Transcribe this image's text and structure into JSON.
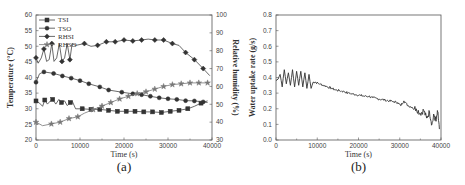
{
  "chart_data": [
    {
      "type": "line",
      "panel_label": "(a)",
      "title": "",
      "xlabel": "Time (s)",
      "ylabel": "Temperature (°C)",
      "y2label": "Relative humidity (%)",
      "xlim": [
        0,
        40000
      ],
      "ylim": [
        20,
        60
      ],
      "y2lim": [
        30,
        100
      ],
      "xticks": [
        "0",
        "10000",
        "20000",
        "30000",
        "40000"
      ],
      "yticks": [
        "20",
        "25",
        "30",
        "35",
        "40",
        "45",
        "50",
        "55",
        "60"
      ],
      "y2ticks": [
        "30",
        "40",
        "50",
        "60",
        "70",
        "80",
        "90",
        "100"
      ],
      "grid": false,
      "legend_position": "upper-left",
      "series": [
        {
          "name": "TSI",
          "axis": "left",
          "marker": "square",
          "x": [
            0,
            800,
            1500,
            2000,
            2600,
            3300,
            3800,
            4500,
            5200,
            5800,
            6500,
            7100,
            7800,
            8200,
            9000,
            10500,
            12500,
            14500,
            16500,
            18500,
            20500,
            22500,
            24500,
            26500,
            28500,
            30500,
            32500,
            34500,
            36000,
            37500,
            39000
          ],
          "values": [
            32.5,
            31.8,
            30.8,
            32.8,
            31.5,
            32.5,
            33,
            31.5,
            33,
            32,
            32.5,
            31,
            32,
            32.5,
            30,
            30,
            29.8,
            29.8,
            29.5,
            29.2,
            29.2,
            29.2,
            29,
            29,
            28.8,
            29.2,
            29.5,
            30,
            30.8,
            31.8,
            32.5
          ]
        },
        {
          "name": "TSO",
          "axis": "left",
          "marker": "circle",
          "x": [
            0,
            800,
            1800,
            4000,
            6000,
            8000,
            10000,
            12000,
            14500,
            16500,
            19500,
            22000,
            24000,
            26000,
            28000,
            30000,
            32000,
            34000,
            36000,
            38000,
            39000
          ],
          "values": [
            38.5,
            41.2,
            41.8,
            41.3,
            40.5,
            39.8,
            39,
            38,
            37,
            36,
            35.3,
            34.8,
            34.5,
            34,
            33.5,
            33.2,
            33,
            32.6,
            32.5,
            32.2,
            32
          ]
        },
        {
          "name": "RHSI",
          "axis": "right",
          "marker": "diamond",
          "x": [
            0,
            500,
            1200,
            1800,
            2400,
            3000,
            3600,
            4100,
            4700,
            5300,
            5900,
            6500,
            7100,
            7700,
            8200,
            9000,
            11000,
            12500,
            14000,
            16000,
            18000,
            20000,
            22000,
            24000,
            25500,
            27000,
            29000,
            31000,
            32500,
            34000,
            36000,
            38000,
            39500
          ],
          "values": [
            76,
            73,
            76,
            81,
            74,
            75,
            84,
            74,
            76,
            84,
            74,
            76,
            84,
            75,
            84,
            83,
            84,
            82.5,
            83,
            85,
            85,
            86,
            85.5,
            86,
            86.5,
            86,
            86,
            84,
            83,
            79,
            75,
            70,
            66
          ]
        },
        {
          "name": "RHSO",
          "axis": "right",
          "marker": "star",
          "x": [
            0,
            1500,
            3500,
            5500,
            7500,
            9500,
            11000,
            13000,
            15000,
            17000,
            19000,
            21000,
            23000,
            25000,
            27000,
            29000,
            31000,
            33000,
            35000,
            37000,
            39000
          ],
          "values": [
            40,
            38,
            39,
            40,
            42,
            43,
            45,
            47,
            49,
            51,
            53,
            54.5,
            56,
            57,
            58.5,
            60,
            61,
            61.5,
            62,
            62,
            62
          ]
        }
      ]
    },
    {
      "type": "line",
      "panel_label": "(b)",
      "title": "",
      "xlabel": "Time (s)",
      "ylabel": "Water uptake rate (g/s)",
      "xlim": [
        0,
        40000
      ],
      "ylim": [
        0.0,
        0.8
      ],
      "xticks": [
        "0",
        "10000",
        "20000",
        "30000",
        "40000"
      ],
      "yticks": [
        "0.0",
        "0.1",
        "0.2",
        "0.3",
        "0.4",
        "0.5",
        "0.6",
        "0.7",
        "0.8"
      ],
      "grid": false,
      "series": [
        {
          "name": "Water uptake rate",
          "x": [
            0,
            500,
            1000,
            1500,
            2000,
            2500,
            3000,
            3500,
            4000,
            4500,
            5000,
            5500,
            6000,
            6500,
            7000,
            7500,
            8000,
            8500,
            9000,
            9500,
            10500,
            11500,
            12500,
            13500,
            14500,
            15500,
            16500,
            17500,
            18500,
            19500,
            20500,
            21500,
            22500,
            23500,
            24500,
            25500,
            26500,
            27500,
            28500,
            29500,
            30200,
            31000,
            32000,
            33000,
            34000,
            35000,
            35800,
            36500,
            37200,
            37800,
            38300,
            38800,
            39200,
            39600
          ],
          "values": [
            0.38,
            0.39,
            0.42,
            0.34,
            0.45,
            0.36,
            0.43,
            0.35,
            0.45,
            0.34,
            0.44,
            0.35,
            0.44,
            0.34,
            0.43,
            0.33,
            0.42,
            0.33,
            0.37,
            0.37,
            0.36,
            0.35,
            0.34,
            0.33,
            0.32,
            0.315,
            0.31,
            0.3,
            0.295,
            0.29,
            0.285,
            0.28,
            0.28,
            0.27,
            0.265,
            0.26,
            0.255,
            0.25,
            0.245,
            0.24,
            0.22,
            0.25,
            0.22,
            0.21,
            0.2,
            0.17,
            0.19,
            0.14,
            0.18,
            0.1,
            0.16,
            0.12,
            0.18,
            0.07
          ]
        }
      ]
    }
  ]
}
